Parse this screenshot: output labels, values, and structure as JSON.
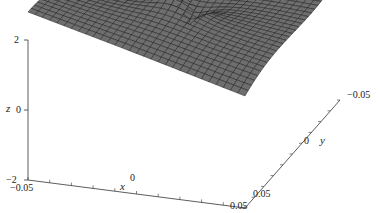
{
  "chart_data": {
    "type": "surface3d",
    "title": "",
    "xlabel": "x",
    "ylabel": "y",
    "zlabel": "z",
    "x_range": [
      -0.05,
      0.05
    ],
    "y_range": [
      -0.05,
      0.05
    ],
    "z_range": [
      -2,
      2
    ],
    "x_ticks": [
      "-0.05",
      "0",
      "0.05"
    ],
    "y_ticks": [
      "-0.05",
      "0",
      "0.05"
    ],
    "z_ticks": [
      "-2",
      "0",
      "2"
    ],
    "surface_color": "#6e6e6e",
    "mesh_color": "#1a1a1a"
  },
  "labels": {
    "z_top": "2",
    "z_mid": "0",
    "z_bot": "−2",
    "z_axis": "z",
    "x_left": "−0.05",
    "x_mid": "0",
    "x_right": "0.05",
    "x_axis": "x",
    "y_near": "0.05",
    "y_mid": "0",
    "y_far": "−0.05",
    "y_axis": "y"
  }
}
